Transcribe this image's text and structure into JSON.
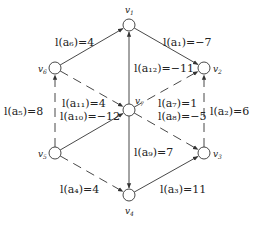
{
  "graph": {
    "nodes": [
      {
        "id": "v1",
        "label": "v",
        "sub": "1",
        "x": 129,
        "y": 25,
        "lx": 125,
        "ly": 13
      },
      {
        "id": "v2",
        "label": "v",
        "sub": "2",
        "x": 204,
        "y": 68,
        "lx": 213,
        "ly": 72
      },
      {
        "id": "v3",
        "label": "v",
        "sub": "3",
        "x": 204,
        "y": 153,
        "lx": 213,
        "ly": 157
      },
      {
        "id": "v4",
        "label": "v",
        "sub": "4",
        "x": 129,
        "y": 195,
        "lx": 125,
        "ly": 214
      },
      {
        "id": "v5",
        "label": "v",
        "sub": "5",
        "x": 55,
        "y": 153,
        "lx": 38,
        "ly": 157
      },
      {
        "id": "v6",
        "label": "v",
        "sub": "6",
        "x": 55,
        "y": 68,
        "lx": 38,
        "ly": 72
      },
      {
        "id": "v7",
        "label": "v",
        "sub": "7",
        "x": 129,
        "y": 110,
        "lx": 135,
        "ly": 104
      }
    ],
    "edges": [
      {
        "id": "a1",
        "from": "v1",
        "to": "v2",
        "style": "solid",
        "length": -7,
        "text": "l(a₁)=−7",
        "tx": 163,
        "ty": 46
      },
      {
        "id": "a2",
        "from": "v3",
        "to": "v2",
        "style": "dashed",
        "length": 6,
        "text": "l(a₂)=6",
        "tx": 210,
        "ty": 115
      },
      {
        "id": "a3",
        "from": "v4",
        "to": "v3",
        "style": "solid",
        "length": 11,
        "text": "l(a₃)=11",
        "tx": 160,
        "ty": 193
      },
      {
        "id": "a4",
        "from": "v5",
        "to": "v4",
        "style": "dashed",
        "length": 4,
        "text": "l(a₄)=4",
        "tx": 60,
        "ty": 193
      },
      {
        "id": "a5",
        "from": "v5",
        "to": "v6",
        "style": "dashed",
        "length": 8,
        "text": "l(a₅)=8",
        "tx": 4,
        "ty": 115
      },
      {
        "id": "a6",
        "from": "v6",
        "to": "v1",
        "style": "solid",
        "length": 4,
        "text": "l(a₆)=4",
        "tx": 55,
        "ty": 46
      },
      {
        "id": "a7",
        "from": "v7",
        "to": "v2",
        "style": "dashed",
        "length": 1,
        "text": "l(a₇)=1",
        "tx": 158,
        "ty": 107
      },
      {
        "id": "a8",
        "from": "v7",
        "to": "v3",
        "style": "dashed",
        "length": -5,
        "text": "l(a₈)=−5",
        "tx": 158,
        "ty": 120
      },
      {
        "id": "a9",
        "from": "v7",
        "to": "v4",
        "style": "solid",
        "length": 7,
        "text": "l(a₉)=7",
        "tx": 134,
        "ty": 156
      },
      {
        "id": "a10",
        "from": "v5",
        "to": "v7",
        "style": "solid",
        "length": -12,
        "text": "l(a₁₀)=−12",
        "tx": 60,
        "ty": 120
      },
      {
        "id": "a11",
        "from": "v6",
        "to": "v7",
        "style": "dashed",
        "length": 4,
        "text": "l(a₁₁)=4",
        "tx": 62,
        "ty": 107
      },
      {
        "id": "a12",
        "from": "v7",
        "to": "v1",
        "style": "solid",
        "length": -11,
        "text": "l(a₁₂)=−11",
        "tx": 134,
        "ty": 72
      }
    ],
    "node_radius": 6,
    "stroke_color": "#333333"
  }
}
